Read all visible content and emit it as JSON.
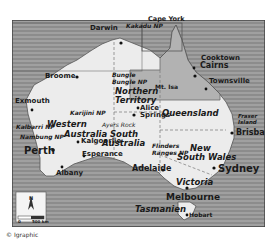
{
  "map": {
    "colors": {
      "sea": "#8a8a8a",
      "sea_stripe": "#9c9c9c",
      "land": "#ededed",
      "highlight_region": "#a8a8a8",
      "border": "#444444"
    },
    "states": [
      {
        "name": "Western Australia",
        "line1": "Western",
        "line2": "Australia"
      },
      {
        "name": "Northern Territory",
        "line1": "Northern",
        "line2": "Territory"
      },
      {
        "name": "South Australia",
        "line1": "South",
        "line2": "Australia"
      },
      {
        "name": "Queensland",
        "line1": "Queensland"
      },
      {
        "name": "New South Wales",
        "line1": "New",
        "line2": "South Wales"
      },
      {
        "name": "Victoria",
        "line1": "Victoria"
      },
      {
        "name": "Tasmanien",
        "line1": "Tasmanien"
      }
    ],
    "cities": {
      "darwin": "Darwin",
      "broome": "Broome",
      "exmouth": "Exmouth",
      "perth": "Perth",
      "albany": "Albany",
      "kalgoorlie": "Kalgoorlie",
      "esperance": "Esperance",
      "alice_springs_1": "Alice",
      "alice_springs_2": "Springs",
      "mt_isa": "Mt. Isa",
      "cooktown": "Cooktown",
      "cairns": "Cairns",
      "townsville": "Townsville",
      "brisbane": "Brisbane",
      "sydney": "Sydney",
      "adelaide": "Adelaide",
      "melbourne": "Melbourne",
      "hobart": "Hobart",
      "cape_york": "Cape York",
      "fraser_island_1": "Fraser",
      "fraser_island_2": "Island"
    },
    "parks": {
      "kakadu": "Kakadu NP",
      "bungle_1": "Bungle",
      "bungle_2": "Bungle NP",
      "karijini": "Karijini NP",
      "kalbarri": "Kalbarri NP",
      "nambung": "Nambung NP",
      "ayers_rock": "Ayers Rock",
      "flinders_1": "Flinders",
      "flinders_2": "Ranges NP"
    },
    "scale": {
      "label": "500 km",
      "zero": "0"
    },
    "north_arrow": "N"
  },
  "credit": "© Igraphic"
}
